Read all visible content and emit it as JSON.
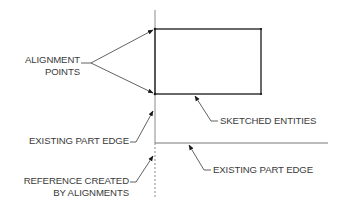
{
  "diagram": {
    "labels": {
      "alignment_points_line1": "ALIGNMENT",
      "alignment_points_line2": "POINTS",
      "existing_part_edge_left": "EXISTING PART EDGE",
      "reference_line1": "REFERENCE CREATED",
      "reference_line2": "BY ALIGNMENTS",
      "sketched_entities": "SKETCHED ENTITIES",
      "existing_part_edge_right": "EXISTING PART EDGE"
    },
    "colors": {
      "line": "#2a2a2a",
      "edge": "#888888",
      "text": "#3a3a3a"
    }
  }
}
